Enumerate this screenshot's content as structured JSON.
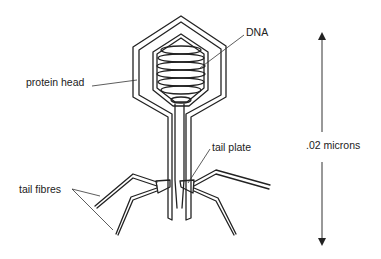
{
  "diagram": {
    "labels": {
      "dna": "DNA",
      "protein_head": "protein head",
      "tail_plate": "tail plate",
      "tail_fibres": "tail fibres",
      "scale": ".02 microns"
    },
    "colors": {
      "line": "#222222",
      "background": "#ffffff"
    }
  }
}
